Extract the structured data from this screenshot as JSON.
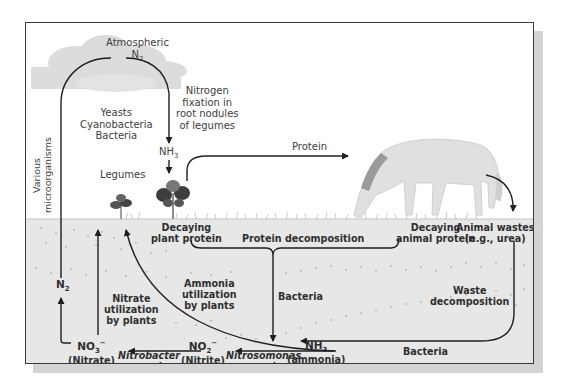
{
  "diagram": {
    "colors": {
      "frame": "#3a3a3a",
      "soil": "#e7e7e7",
      "shadow": "#d4d4d4",
      "arrow": "#1e1e1e",
      "cloud": "#d9d9d9",
      "horse": "#e0e0e0"
    },
    "sky_labels": {
      "atmospheric": "Atmospheric",
      "n2_top": "N",
      "n2_top_sub": "2",
      "fixation": [
        "Nitrogen",
        "fixation in",
        "root nodules",
        "of legumes"
      ],
      "organisms": [
        "Yeasts",
        "Cyanobacteria",
        "Bacteria"
      ],
      "various": [
        "Various",
        "microorganisms"
      ],
      "nh3_plant": "NH",
      "nh3_plant_sub": "3",
      "legumes": "Legumes",
      "protein": "Protein"
    },
    "soil_labels": {
      "decaying_plant": [
        "Decaying",
        "plant protein"
      ],
      "protein_decomposition": "Protein decomposition",
      "decaying_animal": [
        "Decaying",
        "animal protein"
      ],
      "animal_wastes": [
        "Animal wastes",
        "(e.g., urea)"
      ],
      "n2_soil": "N",
      "n2_soil_sub": "2",
      "ammonia_util": [
        "Ammonia",
        "utilization",
        "by plants"
      ],
      "nitrate_util": [
        "Nitrate",
        "utilization",
        "by plants"
      ],
      "bacteria_center": "Bacteria",
      "waste_decomposition": [
        "Waste",
        "decomposition"
      ],
      "bacteria_bottom": "Bacteria",
      "no3": "NO",
      "no3_sub": "3",
      "no3_sup": "−",
      "nitrate": "(Nitrate)",
      "nitrobacter": "Nitrobacter",
      "nitrobacter_species": "species",
      "no2": "NO",
      "no2_sub": "2",
      "no2_sup": "−",
      "nitrite": "(Nitrite)",
      "nitrosomonas": "Nitrosomonas",
      "nitrosomonas_species": "species",
      "nh3": "NH",
      "nh3_sub": "3",
      "ammonia": "(ammonia)"
    },
    "nodes": [
      {
        "id": "atmospheric-n2",
        "label": "Atmospheric N2"
      },
      {
        "id": "nh3-fixed",
        "label": "NH3"
      },
      {
        "id": "legumes",
        "label": "Legumes"
      },
      {
        "id": "horse",
        "label": "Animal"
      },
      {
        "id": "animal-wastes",
        "label": "Animal wastes (e.g., urea)"
      },
      {
        "id": "decaying-plant-protein",
        "label": "Decaying plant protein"
      },
      {
        "id": "decaying-animal-protein",
        "label": "Decaying animal protein"
      },
      {
        "id": "nh3-ammonia",
        "label": "NH3 (ammonia)"
      },
      {
        "id": "no2-nitrite",
        "label": "NO2- (Nitrite)"
      },
      {
        "id": "no3-nitrate",
        "label": "NO3- (Nitrate)"
      },
      {
        "id": "n2-soil",
        "label": "N2"
      }
    ],
    "edges": [
      {
        "from": "atmospheric-n2",
        "to": "nh3-fixed",
        "label": "Nitrogen fixation in root nodules of legumes"
      },
      {
        "from": "nh3-fixed",
        "to": "legumes",
        "label": ""
      },
      {
        "from": "legumes",
        "to": "horse",
        "label": "Protein"
      },
      {
        "from": "horse",
        "to": "animal-wastes",
        "label": ""
      },
      {
        "from": "decaying-plant-protein",
        "to": "nh3-ammonia",
        "label": "Protein decomposition / Bacteria"
      },
      {
        "from": "decaying-animal-protein",
        "to": "nh3-ammonia",
        "label": "Protein decomposition / Bacteria"
      },
      {
        "from": "animal-wastes",
        "to": "nh3-ammonia",
        "label": "Waste decomposition / Bacteria"
      },
      {
        "from": "nh3-ammonia",
        "to": "legumes",
        "label": "Ammonia utilization by plants"
      },
      {
        "from": "nh3-ammonia",
        "to": "no2-nitrite",
        "label": "Nitrosomonas species"
      },
      {
        "from": "no2-nitrite",
        "to": "no3-nitrate",
        "label": "Nitrobacter species"
      },
      {
        "from": "no3-nitrate",
        "to": "legumes",
        "label": "Nitrate utilization by plants"
      },
      {
        "from": "no3-nitrate",
        "to": "n2-soil",
        "label": ""
      },
      {
        "from": "n2-soil",
        "to": "atmospheric-n2",
        "label": "Various microorganisms"
      }
    ]
  }
}
